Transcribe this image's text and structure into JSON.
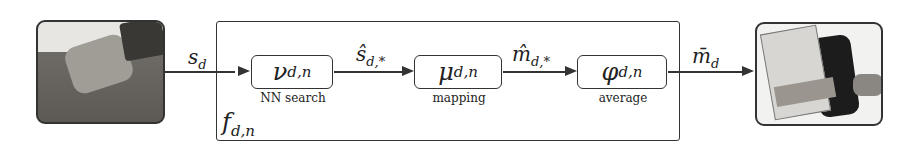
{
  "inputs": {
    "left_image": "robot hand (human-like) grasping object",
    "right_image": "robot gripper grasping object"
  },
  "signals": {
    "s_d": {
      "base": "s",
      "sub": "d"
    },
    "s_hat": {
      "base": "ŝ",
      "sub": "d,*"
    },
    "m_hat": {
      "base": "m̂",
      "sub": "d,*"
    },
    "m_bar": {
      "base": "m̄",
      "sub": "d"
    }
  },
  "outer": {
    "base": "f",
    "sub": "d,n"
  },
  "blocks": [
    {
      "base": "ν",
      "sub": "d,n",
      "label": "NN search"
    },
    {
      "base": "μ",
      "sub": "d,n",
      "label": "mapping"
    },
    {
      "base": "φ",
      "sub": "d,n",
      "label": "average"
    }
  ]
}
